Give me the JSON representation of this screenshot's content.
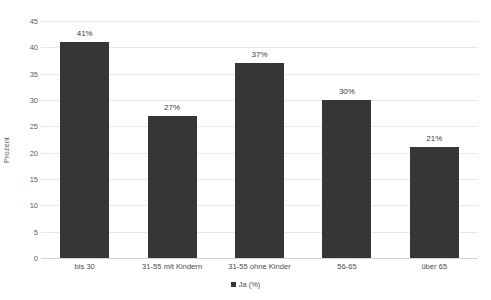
{
  "chart_data": {
    "type": "bar",
    "title": "",
    "subtitle": "",
    "xlabel": "",
    "ylabel": "Prozent",
    "ylim": [
      0,
      45
    ],
    "ytick_step": 5,
    "yticks": [
      "45",
      "40",
      "35",
      "30",
      "25",
      "20",
      "15",
      "10",
      "5",
      "0"
    ],
    "grid": true,
    "legend_position": "bottom-center",
    "categories": [
      "bis 30",
      "31-55 mit Kindern",
      "31-55 ohne Kinder",
      "56-65",
      "über 65"
    ],
    "values": [
      41,
      27,
      37,
      30,
      21
    ],
    "data_labels": [
      "41%",
      "27%",
      "37%",
      "30%",
      "21%"
    ],
    "series": [
      {
        "name": "Ja (%)",
        "values": [
          41,
          27,
          37,
          30,
          21
        ],
        "color": "#363636"
      }
    ],
    "legend": [
      {
        "label": "Ja (%)",
        "color": "#363636",
        "marker": "square-marker"
      }
    ]
  },
  "axis": {
    "y_title": "Prozent"
  },
  "colors": {
    "bar": "#363636",
    "gridline": "#e8e8e8",
    "axis_text": "#5e5e5e",
    "background": "#ffffff"
  }
}
